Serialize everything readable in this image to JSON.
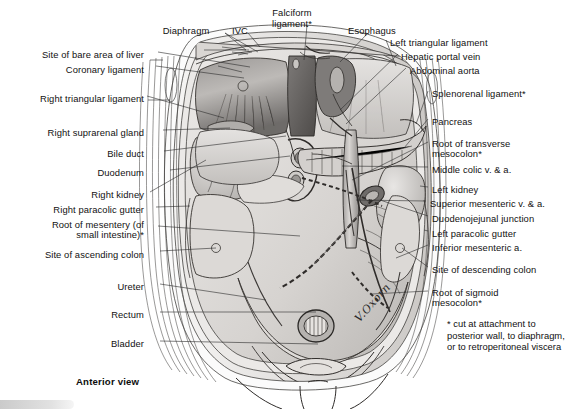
{
  "figure": {
    "view_label": "Anterior view",
    "signature": "V.Oxorn",
    "footnote": "* cut at attachment to posterior wall, to diaphragm, or to retroperitoneal viscera",
    "ink_color": "#2b2b2b",
    "background_color": "#ffffff",
    "tissue_light": "#e6e4e2",
    "tissue_mid": "#c9c6c3",
    "tissue_dark": "#8e8b88",
    "tissue_darkest": "#5c5957"
  },
  "labels_top": [
    {
      "text": "Diaphragm",
      "x": 186,
      "y": 26
    },
    {
      "text": "IVC",
      "x": 240,
      "y": 26
    },
    {
      "text": "Falciform\nligament*",
      "x": 292,
      "y": 8
    },
    {
      "text": "Esophagus",
      "x": 372,
      "y": 26
    }
  ],
  "labels_left": [
    {
      "text": "Site of bare area of liver",
      "x": 144,
      "y": 50
    },
    {
      "text": "Coronary ligament",
      "x": 144,
      "y": 65
    },
    {
      "text": "Right triangular ligament",
      "x": 144,
      "y": 94
    },
    {
      "text": "Right suprarenal gland",
      "x": 144,
      "y": 128
    },
    {
      "text": "Bile duct",
      "x": 144,
      "y": 149
    },
    {
      "text": "Duodenum",
      "x": 144,
      "y": 168
    },
    {
      "text": "Right kidney",
      "x": 144,
      "y": 190
    },
    {
      "text": "Right paracolic gutter",
      "x": 144,
      "y": 205
    },
    {
      "text": "Root of mesentery (of",
      "x": 144,
      "y": 220
    },
    {
      "text": "small intestine)*",
      "x": 144,
      "y": 230
    },
    {
      "text": "Site of ascending colon",
      "x": 144,
      "y": 250
    },
    {
      "text": "Ureter",
      "x": 144,
      "y": 282
    },
    {
      "text": "Rectum",
      "x": 144,
      "y": 310
    },
    {
      "text": "Bladder",
      "x": 144,
      "y": 339
    }
  ],
  "labels_right": [
    {
      "text": "Left triangular ligament",
      "x": 390,
      "y": 38
    },
    {
      "text": "Hepatic portal vein",
      "x": 401,
      "y": 52
    },
    {
      "text": "Abdominal aorta",
      "x": 410,
      "y": 66
    },
    {
      "text": "Splenorenal ligament*",
      "x": 432,
      "y": 89
    },
    {
      "text": "Pancreas",
      "x": 432,
      "y": 117
    },
    {
      "text": "Root of transverse",
      "x": 432,
      "y": 139
    },
    {
      "text": "mesocolon*",
      "x": 432,
      "y": 149
    },
    {
      "text": "Middle colic v. & a.",
      "x": 432,
      "y": 165
    },
    {
      "text": "Left kidney",
      "x": 432,
      "y": 185
    },
    {
      "text": "Superior mesenteric v. & a.",
      "x": 430,
      "y": 199
    },
    {
      "text": "Duodenojejunal junction",
      "x": 432,
      "y": 214
    },
    {
      "text": "Left paracolic gutter",
      "x": 432,
      "y": 229
    },
    {
      "text": "Inferior mesenteric a.",
      "x": 432,
      "y": 243
    },
    {
      "text": "Site of descending colon",
      "x": 432,
      "y": 265
    },
    {
      "text": "Root of sigmoid",
      "x": 432,
      "y": 288
    },
    {
      "text": "mesocolon*",
      "x": 432,
      "y": 298
    }
  ],
  "anatomy_structures": [
    "diaphragm",
    "inferior-vena-cava",
    "falciform-ligament",
    "esophagus",
    "left-triangular-ligament",
    "hepatic-portal-vein",
    "abdominal-aorta",
    "splenorenal-ligament",
    "pancreas",
    "root-of-transverse-mesocolon",
    "middle-colic-vessels",
    "left-kidney",
    "superior-mesenteric-vessels",
    "duodenojejunal-junction",
    "left-paracolic-gutter",
    "inferior-mesenteric-artery",
    "site-of-descending-colon",
    "root-of-sigmoid-mesocolon",
    "site-of-bare-area-of-liver",
    "coronary-ligament",
    "right-triangular-ligament",
    "right-suprarenal-gland",
    "bile-duct",
    "duodenum",
    "right-kidney",
    "right-paracolic-gutter",
    "root-of-mesentery",
    "site-of-ascending-colon",
    "ureter",
    "rectum",
    "bladder"
  ]
}
